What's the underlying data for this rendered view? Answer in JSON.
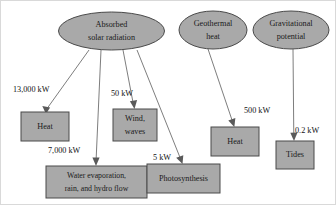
{
  "diagram": {
    "type": "flow-diagram",
    "background_color": "#ffffff",
    "node_fill_color": "#a9a9a9",
    "node_stroke_color": "#4a4a4a",
    "edge_color": "#6e6e6e",
    "sources": [
      {
        "id": "absorbed-solar-radiation",
        "shape": "ellipse",
        "line1": "Absorbed",
        "line2": "solar radiation",
        "cx": 110.5,
        "cy": 30,
        "rx": 53,
        "ry": 19
      },
      {
        "id": "geothermal-heat",
        "shape": "ellipse",
        "line1": "Geothermal",
        "line2": "heat",
        "cx": 212,
        "cy": 29,
        "rx": 34,
        "ry": 19
      },
      {
        "id": "gravitational-potential",
        "shape": "ellipse",
        "line1": "Gravitational",
        "line2": "potential",
        "cx": 290,
        "cy": 29,
        "rx": 38,
        "ry": 19
      }
    ],
    "sinks": [
      {
        "id": "heat-solar",
        "shape": "rect",
        "line1": "Heat",
        "line2": "",
        "x": 20,
        "y": 111,
        "w": 48,
        "h": 29
      },
      {
        "id": "wind-waves",
        "shape": "rect",
        "line1": "Wind,",
        "line2": "waves",
        "x": 112,
        "y": 108,
        "w": 44,
        "h": 32
      },
      {
        "id": "water-evaporation",
        "shape": "rect",
        "line1": "Water evaporation,",
        "line2": "rain, and hydro flow",
        "x": 45,
        "y": 165,
        "w": 101,
        "h": 32
      },
      {
        "id": "photosynthesis",
        "shape": "rect",
        "line1": "Photosynthesis",
        "line2": "",
        "x": 146,
        "y": 163,
        "w": 73,
        "h": 29
      },
      {
        "id": "heat-geothermal",
        "shape": "rect",
        "line1": "Heat",
        "line2": "",
        "x": 210,
        "y": 126,
        "w": 48,
        "h": 29
      },
      {
        "id": "tides",
        "shape": "rect",
        "line1": "Tides",
        "line2": "",
        "x": 275,
        "y": 140,
        "w": 38,
        "h": 28
      }
    ],
    "flows": [
      {
        "id": "flow-heat-solar",
        "from": "absorbed-solar-radiation",
        "to": "heat-solar",
        "label": "13,000 kW",
        "label_x": 12,
        "label_y": 89,
        "x1": 88,
        "y1": 49,
        "x2": 45,
        "y2": 109
      },
      {
        "id": "flow-water-evaporation",
        "from": "absorbed-solar-radiation",
        "to": "water-evaporation",
        "label": "7,000 kW",
        "label_x": 47,
        "label_y": 150,
        "x1": 100,
        "y1": 49,
        "x2": 95,
        "y2": 163
      },
      {
        "id": "flow-wind-waves",
        "from": "absorbed-solar-radiation",
        "to": "wind-waves",
        "label": "50 kW",
        "label_x": 110,
        "label_y": 93,
        "x1": 122,
        "y1": 49,
        "x2": 133,
        "y2": 106
      },
      {
        "id": "flow-photosynthesis",
        "from": "absorbed-solar-radiation",
        "to": "photosynthesis",
        "label": "5 kW",
        "label_x": 152,
        "label_y": 157,
        "x1": 136,
        "y1": 49,
        "x2": 181,
        "y2": 161
      },
      {
        "id": "flow-heat-geothermal",
        "from": "geothermal-heat",
        "to": "heat-geothermal",
        "label": "500 kW",
        "label_x": 243,
        "label_y": 110,
        "x1": 207,
        "y1": 48,
        "x2": 233,
        "y2": 124
      },
      {
        "id": "flow-tides",
        "from": "gravitational-potential",
        "to": "tides",
        "label": "0.2 kW",
        "label_x": 294,
        "label_y": 130,
        "x1": 292,
        "y1": 48,
        "x2": 293,
        "y2": 138
      }
    ]
  }
}
